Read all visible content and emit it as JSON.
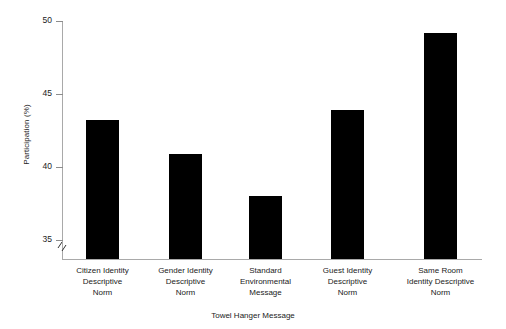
{
  "chart_data": {
    "type": "bar",
    "title": "",
    "xlabel": "Towel Hanger Message",
    "ylabel": "Participation (%)",
    "categories": [
      "Citizen Identity Descriptive Norm",
      "Gender Identity Descriptive Norm",
      "Standard Environmental Message",
      "Guest Identity Descriptive Norm",
      "Same Room Identity Descriptive Norm"
    ],
    "category_lines": [
      [
        "Citizen Identity",
        "Descriptive",
        "Norm"
      ],
      [
        "Gender Identity",
        "Descriptive",
        "Norm"
      ],
      [
        "Standard",
        "Environmental",
        "Message"
      ],
      [
        "Guest Identity",
        "Descriptive",
        "Norm"
      ],
      [
        "Same Room",
        "Identity Descriptive",
        "Norm"
      ]
    ],
    "values": [
      43.2,
      40.9,
      38.0,
      43.9,
      49.2
    ],
    "ylim": [
      34.2,
      50
    ],
    "yticks": [
      35,
      40,
      45,
      50
    ],
    "ytick_labels": [
      "35",
      "40",
      "45",
      "50"
    ],
    "axis_break": true,
    "grid": false,
    "legend": null,
    "bar_color": "#000000",
    "axis_color": "#a9a9a9",
    "text_color": "#222222",
    "background_color": "#ffffff"
  }
}
